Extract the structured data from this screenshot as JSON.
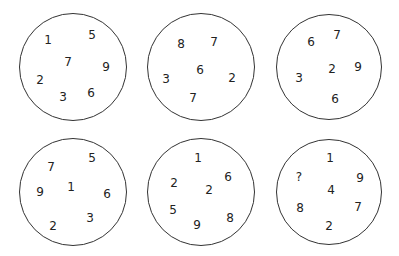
{
  "puzzle": {
    "title": "",
    "circles": [
      {
        "id": "c1",
        "cx": 73,
        "cy": 67,
        "r": 54,
        "numbers": [
          {
            "value": "1",
            "x": 48,
            "y": 40
          },
          {
            "value": "5",
            "x": 92,
            "y": 35
          },
          {
            "value": "7",
            "x": 68,
            "y": 62
          },
          {
            "value": "9",
            "x": 106,
            "y": 67
          },
          {
            "value": "2",
            "x": 40,
            "y": 80
          },
          {
            "value": "3",
            "x": 63,
            "y": 97
          },
          {
            "value": "6",
            "x": 91,
            "y": 93
          }
        ]
      },
      {
        "id": "c2",
        "cx": 201,
        "cy": 67,
        "r": 54,
        "numbers": [
          {
            "value": "8",
            "x": 181,
            "y": 44
          },
          {
            "value": "7",
            "x": 214,
            "y": 42
          },
          {
            "value": "6",
            "x": 200,
            "y": 70
          },
          {
            "value": "3",
            "x": 166,
            "y": 79
          },
          {
            "value": "2",
            "x": 232,
            "y": 78
          },
          {
            "value": "7",
            "x": 193,
            "y": 98
          }
        ]
      },
      {
        "id": "c3",
        "cx": 329,
        "cy": 67,
        "r": 53,
        "numbers": [
          {
            "value": "6",
            "x": 311,
            "y": 42
          },
          {
            "value": "7",
            "x": 337,
            "y": 35
          },
          {
            "value": "2",
            "x": 332,
            "y": 69
          },
          {
            "value": "9",
            "x": 358,
            "y": 67
          },
          {
            "value": "3",
            "x": 299,
            "y": 78
          },
          {
            "value": "6",
            "x": 335,
            "y": 99
          }
        ]
      },
      {
        "id": "c4",
        "cx": 73,
        "cy": 192,
        "r": 54,
        "numbers": [
          {
            "value": "7",
            "x": 51,
            "y": 167
          },
          {
            "value": "5",
            "x": 92,
            "y": 158
          },
          {
            "value": "1",
            "x": 71,
            "y": 187
          },
          {
            "value": "9",
            "x": 40,
            "y": 192
          },
          {
            "value": "6",
            "x": 107,
            "y": 194
          },
          {
            "value": "3",
            "x": 90,
            "y": 218
          },
          {
            "value": "2",
            "x": 53,
            "y": 226
          }
        ]
      },
      {
        "id": "c5",
        "cx": 201,
        "cy": 192,
        "r": 54,
        "numbers": [
          {
            "value": "1",
            "x": 198,
            "y": 158
          },
          {
            "value": "2",
            "x": 174,
            "y": 183
          },
          {
            "value": "6",
            "x": 228,
            "y": 177
          },
          {
            "value": "2",
            "x": 209,
            "y": 190
          },
          {
            "value": "5",
            "x": 173,
            "y": 210
          },
          {
            "value": "8",
            "x": 230,
            "y": 218
          },
          {
            "value": "9",
            "x": 197,
            "y": 225
          }
        ]
      },
      {
        "id": "c6",
        "cx": 329,
        "cy": 192,
        "r": 53,
        "numbers": [
          {
            "value": "1",
            "x": 330,
            "y": 158
          },
          {
            "value": "?",
            "x": 299,
            "y": 177
          },
          {
            "value": "9",
            "x": 360,
            "y": 178
          },
          {
            "value": "4",
            "x": 331,
            "y": 190
          },
          {
            "value": "8",
            "x": 300,
            "y": 208
          },
          {
            "value": "7",
            "x": 358,
            "y": 207
          },
          {
            "value": "2",
            "x": 329,
            "y": 226
          }
        ]
      }
    ]
  }
}
